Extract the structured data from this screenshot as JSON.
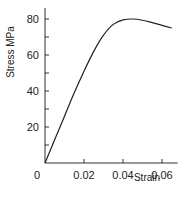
{
  "chart_data": {
    "type": "line",
    "title": "",
    "xlabel": "Strain",
    "ylabel": "Stress MPa",
    "xlim": [
      0,
      0.067
    ],
    "ylim": [
      0,
      85
    ],
    "xticks": [
      0,
      0.02,
      0.04,
      0.06
    ],
    "xtick_labels": [
      "0",
      "0.02",
      "0.04",
      "0.06"
    ],
    "yticks": [
      0,
      10,
      20,
      30,
      40,
      50,
      60,
      70,
      80
    ],
    "ytick_labels": [
      "",
      "",
      "20",
      "",
      "40",
      "",
      "60",
      "",
      "80"
    ],
    "origin_label": "0",
    "grid": false,
    "legend": null,
    "series": [
      {
        "name": "stress-strain",
        "color": "#222222",
        "x": [
          0,
          0.005,
          0.01,
          0.015,
          0.02,
          0.025,
          0.03,
          0.035,
          0.04,
          0.045,
          0.05,
          0.055,
          0.06,
          0.065
        ],
        "y": [
          0,
          13,
          26,
          39,
          51,
          62,
          71,
          77,
          79.5,
          80,
          79.3,
          78,
          76.5,
          75
        ]
      }
    ]
  }
}
